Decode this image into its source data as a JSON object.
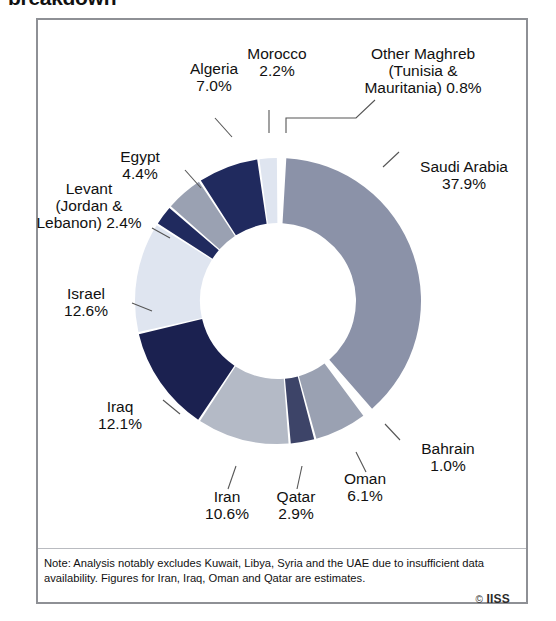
{
  "title": "breakdown",
  "note": {
    "line1": "Note: Analysis notably excludes Kuwait, Libya, Syria and the UAE due to insufficient data",
    "line2": "availability. Figures for Iran, Iraq, Oman and Qatar are estimates."
  },
  "credit": {
    "symbol": "©",
    "text": "IISS"
  },
  "colors": {
    "navy_deep": "#1b2150",
    "navy": "#202a5e",
    "slate_dark": "#3d4468",
    "slate": "#8b92a8",
    "gray": "#9aa1b2",
    "gray_light": "#b4bac6",
    "pale": "#dfe5f0",
    "white": "#ffffff",
    "border": "#8e9095",
    "leader": "#555555"
  },
  "chart_data": {
    "type": "pie",
    "title": "breakdown",
    "donut": true,
    "units": "%",
    "start_angle_deg": 0,
    "direction": "clockwise",
    "categories": [
      "Other Maghreb (Tunisia & Mauritania)",
      "Saudi Arabia",
      "Bahrain",
      "Oman",
      "Qatar",
      "Iran",
      "Iraq",
      "Israel",
      "Levant (Jordan & Lebanon)",
      "Egypt",
      "Algeria",
      "Morocco"
    ],
    "values": [
      0.8,
      37.9,
      1.0,
      6.1,
      2.9,
      10.6,
      12.1,
      12.6,
      2.4,
      4.4,
      7.0,
      2.2
    ],
    "slice_colors": [
      "#ffffff",
      "#8b92a8",
      "#ffffff",
      "#9aa1b2",
      "#3d4468",
      "#b4bac6",
      "#1b2150",
      "#dfe5f0",
      "#202a5e",
      "#9aa1b2",
      "#202a5e",
      "#dfe5f0"
    ],
    "legend": "none",
    "labels": [
      {
        "name": "other-maghreb",
        "text": "Other Maghreb\n(Tunisia &\nMauritania) 0.8%",
        "value": 0.8
      },
      {
        "name": "saudi-arabia",
        "text": "Saudi Arabia\n37.9%",
        "value": 37.9
      },
      {
        "name": "bahrain",
        "text": "Bahrain\n1.0%",
        "value": 1.0
      },
      {
        "name": "oman",
        "text": "Oman\n6.1%",
        "value": 6.1
      },
      {
        "name": "qatar",
        "text": "Qatar\n2.9%",
        "value": 2.9
      },
      {
        "name": "iran",
        "text": "Iran\n10.6%",
        "value": 10.6
      },
      {
        "name": "iraq",
        "text": "Iraq\n12.1%",
        "value": 12.1
      },
      {
        "name": "israel",
        "text": "Israel\n12.6%",
        "value": 12.6
      },
      {
        "name": "levant",
        "text": "Levant\n(Jordan &\nLebanon) 2.4%",
        "value": 2.4
      },
      {
        "name": "egypt",
        "text": "Egypt\n4.4%",
        "value": 4.4
      },
      {
        "name": "algeria",
        "text": "Algeria\n7.0%",
        "value": 7.0
      },
      {
        "name": "morocco",
        "text": "Morocco\n2.2%",
        "value": 2.2
      }
    ]
  }
}
